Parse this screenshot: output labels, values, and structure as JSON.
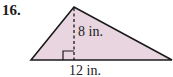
{
  "problem": {
    "number": "16.",
    "shape": "triangle",
    "fill_color": "#e8d5e0",
    "stroke_color": "#1a1a1a",
    "height_label": "8 in.",
    "base_label": "12 in."
  }
}
